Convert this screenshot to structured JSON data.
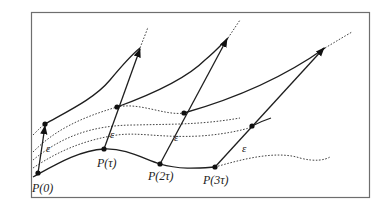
{
  "figure": {
    "points": [
      {
        "label": "P(0)",
        "x": 38,
        "y": 173
      },
      {
        "label": "P(τ)",
        "x": 104,
        "y": 149
      },
      {
        "label": "P(2τ)",
        "x": 160,
        "y": 164
      },
      {
        "label": "P(3τ)",
        "x": 215,
        "y": 167
      }
    ],
    "perturbed_points": [
      {
        "x": 45,
        "y": 124
      },
      {
        "x": 117,
        "y": 107
      },
      {
        "x": 184,
        "y": 113
      },
      {
        "x": 252,
        "y": 126
      }
    ],
    "epsilon_label": "ε",
    "labels": {
      "p0": "P(0)",
      "p1": "P(τ)",
      "p2": "P(2τ)",
      "p3": "P(3τ)",
      "eps": "ε"
    },
    "colors": {
      "line": "#1e1e1e",
      "frame": "#6e6e6e",
      "background": "#ffffff"
    }
  }
}
